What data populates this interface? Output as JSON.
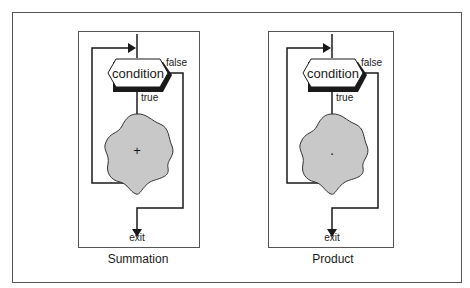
{
  "figure": {
    "panels": [
      {
        "caption": "Summation",
        "condition_label": "condition",
        "true_label": "true",
        "false_label": "false",
        "exit_label": "exit",
        "body_symbol": "+",
        "body_fill": "#c8c8c8"
      },
      {
        "caption": "Product",
        "condition_label": "condition",
        "true_label": "true",
        "false_label": "false",
        "exit_label": "exit",
        "body_symbol": "·",
        "body_fill": "#c8c8c8"
      }
    ]
  }
}
